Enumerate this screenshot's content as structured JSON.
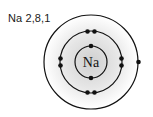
{
  "diagram": {
    "title": "Na 2,8,1",
    "element_symbol": "Na",
    "configuration": [
      2,
      8,
      1
    ],
    "nucleus": {
      "cx": 91,
      "cy": 62,
      "r": 16
    },
    "shells": [
      {
        "name": "shell-1",
        "r": 16,
        "electrons": 2
      },
      {
        "name": "shell-2",
        "r": 31,
        "electrons": 8
      },
      {
        "name": "shell-3",
        "r": 47,
        "electrons": 1
      }
    ],
    "colors": {
      "line": "#111111",
      "electron": "#111111",
      "shade_inner": "#d6d6d6",
      "shade_outer": "#ffffff"
    }
  }
}
